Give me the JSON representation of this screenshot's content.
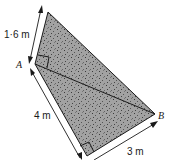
{
  "diagram": {
    "type": "kite-quadrilateral-with-diagonal",
    "vertices": {
      "A": "A",
      "B": "B"
    },
    "measurements": {
      "top_edge": "1·6 m",
      "left_edge": "4 m",
      "bottom_edge": "3 m"
    },
    "right_angles": [
      "at A",
      "at bottom vertex"
    ],
    "colors": {
      "fill": "#9a9a9a",
      "stroke": "#1a1a1a",
      "speckle": "#3a3a3a"
    }
  }
}
